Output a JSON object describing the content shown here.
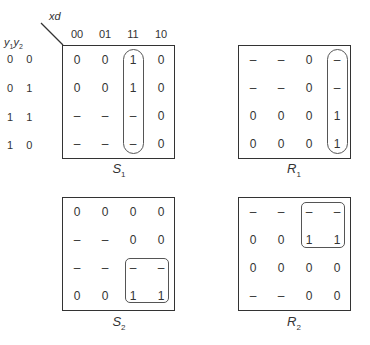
{
  "axes": {
    "col_var": "xd",
    "row_var_1": "y",
    "row_var_1_sub": "1",
    "row_var_2": "y",
    "row_var_2_sub": "2",
    "columns": [
      "00",
      "01",
      "11",
      "10"
    ],
    "rows": [
      "0 0",
      "0 1",
      "1 1",
      "1 0"
    ]
  },
  "maps": [
    {
      "name": "S1",
      "label": "S",
      "label_sub": "1",
      "cells": [
        [
          "0",
          "0",
          "1",
          "0"
        ],
        [
          "0",
          "0",
          "1",
          "0"
        ],
        [
          "–",
          "–",
          "–",
          "0"
        ],
        [
          "–",
          "–",
          "–",
          "0"
        ]
      ],
      "group": "column 11, all rows (rounded oval)"
    },
    {
      "name": "R1",
      "label": "R",
      "label_sub": "1",
      "cells": [
        [
          "–",
          "–",
          "0",
          "–"
        ],
        [
          "–",
          "–",
          "0",
          "–"
        ],
        [
          "0",
          "0",
          "0",
          "1"
        ],
        [
          "0",
          "0",
          "0",
          "1"
        ]
      ],
      "group": "column 10, all rows (rounded oval)"
    },
    {
      "name": "S2",
      "label": "S",
      "label_sub": "2",
      "cells": [
        [
          "0",
          "0",
          "0",
          "0"
        ],
        [
          "–",
          "–",
          "0",
          "0"
        ],
        [
          "–",
          "–",
          "–",
          "–"
        ],
        [
          "0",
          "0",
          "1",
          "1"
        ]
      ],
      "group": "columns 11-10, rows 11-10 (rounded rectangle)"
    },
    {
      "name": "R2",
      "label": "R",
      "label_sub": "2",
      "cells": [
        [
          "–",
          "–",
          "–",
          "–"
        ],
        [
          "0",
          "0",
          "1",
          "1"
        ],
        [
          "0",
          "0",
          "0",
          "0"
        ],
        [
          "–",
          "–",
          "0",
          "0"
        ]
      ],
      "group": "columns 11-10, rows 00-01 (rounded rectangle)"
    }
  ]
}
